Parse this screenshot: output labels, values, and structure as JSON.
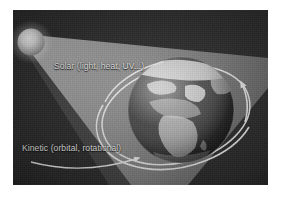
{
  "figure": {
    "kind": "earth-energy-inputs-diagram",
    "page_background": "#ffffff",
    "panel_background": "#2b2b2b"
  },
  "labels": {
    "solar": "Solar (light, heat, UV...)",
    "kinetic": "Kinetic (orbital, rotational)"
  },
  "elements": {
    "sun_name": "Sun",
    "earth_name": "Earth",
    "beam_name": "Solar radiation cone",
    "orbit_name": "Orbital / rotational path ellipse",
    "rotation_arrow_name": "Rotation direction arrow",
    "kinetic_arrow_name": "Kinetic energy pointer arrow"
  },
  "colors": {
    "background": "#2b2b2b",
    "beam": "#9a9a9a",
    "sun_core": "#ffffff",
    "sun_edge": "#8d8d8d",
    "ocean": "#2f2f2f",
    "land": "#d8d8d8",
    "orbit_line": "#e8e8e8",
    "label_text": "#f2f2f2",
    "page": "#ffffff"
  }
}
